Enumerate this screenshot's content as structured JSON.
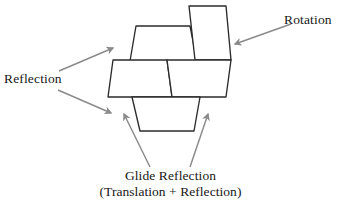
{
  "figure": {
    "background_color": "#ffffff",
    "stroke_color": "#2b2b2b",
    "fill_color": "#ffffff",
    "arrow_color": "#8a8a8a",
    "text_color": "#171717"
  },
  "labels": {
    "reflection": "Reflection",
    "rotation": "Rotation",
    "glide_line1": "Glide Reflection",
    "glide_line2": "(Translation + Reflection)"
  },
  "shapes": [
    {
      "name": "upper-trapezoid",
      "points": "136,26 190,26 197,61 130,61"
    },
    {
      "name": "rotated-parallelogram",
      "points": "189,6 226,6 231,60 195,60"
    },
    {
      "name": "middle-left-parallelogram",
      "points": "113,60 167,60 172,97 108,97"
    },
    {
      "name": "middle-right-parallelogram",
      "points": "167,60 231,60 226,97 172,97"
    },
    {
      "name": "lower-trapezoid",
      "points": "132,97 200,97 194,131 140,131"
    }
  ],
  "arrows": [
    {
      "name": "reflection-upper-arrow",
      "from": [
        59,
        71
      ],
      "to": [
        113,
        48
      ]
    },
    {
      "name": "reflection-lower-arrow",
      "from": [
        58,
        90
      ],
      "to": [
        111,
        113
      ]
    },
    {
      "name": "rotation-arrow",
      "from": [
        291,
        24
      ],
      "to": [
        235,
        44
      ]
    },
    {
      "name": "glide-left-arrow",
      "from": [
        150,
        167
      ],
      "to": [
        124,
        114
      ]
    },
    {
      "name": "glide-right-arrow",
      "from": [
        190,
        167
      ],
      "to": [
        208,
        114
      ]
    }
  ],
  "chart_data": {
    "type": "diagram",
    "annotations": [
      {
        "label": "Reflection",
        "target": "upper-trapezoid / middle-left-parallelogram",
        "position": "left"
      },
      {
        "label": "Rotation",
        "target": "rotated-parallelogram",
        "position": "right"
      },
      {
        "label": "Glide Reflection (Translation + Reflection)",
        "target": "lower-trapezoid",
        "position": "bottom"
      }
    ],
    "tile_count": 5
  }
}
